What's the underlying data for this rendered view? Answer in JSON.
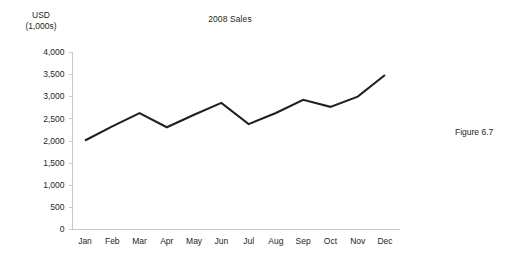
{
  "figure": {
    "caption": "Figure 6.7"
  },
  "chart_data": {
    "type": "line",
    "title": "2008 Sales",
    "xlabel": "",
    "ylabel": "USD (1,000s)",
    "ylabel_lines": [
      "USD",
      "(1,000s)"
    ],
    "categories": [
      "Jan",
      "Feb",
      "Mar",
      "Apr",
      "May",
      "Jun",
      "Jul",
      "Aug",
      "Sep",
      "Oct",
      "Nov",
      "Dec"
    ],
    "values": [
      2000,
      2320,
      2620,
      2300,
      2580,
      2850,
      2370,
      2620,
      2920,
      2760,
      2990,
      3480
    ],
    "series": [
      {
        "name": "2008 Sales",
        "values": [
          2000,
          2320,
          2620,
          2300,
          2580,
          2850,
          2370,
          2620,
          2920,
          2760,
          2990,
          3480
        ]
      }
    ],
    "ylim": [
      0,
      4000
    ],
    "ytick_values": [
      0,
      500,
      1000,
      1500,
      2000,
      2500,
      3000,
      3500,
      4000
    ],
    "ytick_labels": [
      "0",
      "500",
      "1,000",
      "1,500",
      "2,000",
      "2,500",
      "3,000",
      "3,500",
      "4,000"
    ],
    "grid": false,
    "legend": false,
    "line_color": "#231f20",
    "axis_color": "#c9c9c9"
  }
}
